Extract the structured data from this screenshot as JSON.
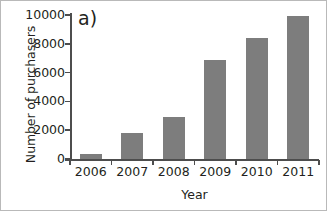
{
  "chart_data": {
    "type": "bar",
    "title": "",
    "panel_label": "a)",
    "categories": [
      "2006",
      "2007",
      "2008",
      "2009",
      "2010",
      "2011"
    ],
    "values": [
      350,
      1800,
      2900,
      6900,
      8400,
      9900
    ],
    "series": [
      {
        "name": "Number of purchasers",
        "values": [
          350,
          1800,
          2900,
          6900,
          8400,
          9900
        ]
      }
    ],
    "xlabel": "Year",
    "ylabel": "Number of purchasers",
    "ylim": [
      0,
      10000
    ],
    "yticks": [
      0,
      2000,
      4000,
      6000,
      8000,
      10000
    ],
    "ytick_labels": [
      "0",
      "2000",
      "4000",
      "6000",
      "8000",
      "10000"
    ],
    "grid": false,
    "legend": null,
    "bar_color": "#7d7d7d",
    "axis_color": "#4d4d4d",
    "text_color": "#231f20",
    "background": "#ffffff"
  }
}
